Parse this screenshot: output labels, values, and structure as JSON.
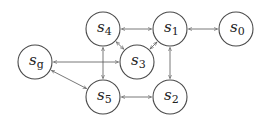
{
  "diagram": {
    "type": "state-graph",
    "node_radius": 17,
    "colors": {
      "stroke": "#4a4a4a",
      "edge": "#555555",
      "text": "#222222",
      "fill": "#ffffff"
    },
    "nodes": [
      {
        "id": "sg",
        "label": "s",
        "sub": "g",
        "x": 35,
        "y": 62
      },
      {
        "id": "s4",
        "label": "s",
        "sub": "4",
        "x": 103,
        "y": 29
      },
      {
        "id": "s1",
        "label": "s",
        "sub": "1",
        "x": 170,
        "y": 29
      },
      {
        "id": "s0",
        "label": "s",
        "sub": "0",
        "x": 236,
        "y": 29
      },
      {
        "id": "s3",
        "label": "s",
        "sub": "3",
        "x": 137,
        "y": 62
      },
      {
        "id": "s5",
        "label": "s",
        "sub": "5",
        "x": 103,
        "y": 97
      },
      {
        "id": "s2",
        "label": "s",
        "sub": "2",
        "x": 170,
        "y": 97
      }
    ],
    "edges": [
      {
        "from": "s4",
        "to": "s1",
        "bidirectional": true
      },
      {
        "from": "s1",
        "to": "s0",
        "bidirectional": true
      },
      {
        "from": "s4",
        "to": "s3",
        "bidirectional": true
      },
      {
        "from": "s1",
        "to": "s3",
        "bidirectional": true
      },
      {
        "from": "s4",
        "to": "s5",
        "bidirectional": true
      },
      {
        "from": "s1",
        "to": "s2",
        "bidirectional": true
      },
      {
        "from": "s5",
        "to": "s2",
        "bidirectional": true
      },
      {
        "from": "sg",
        "to": "s3",
        "bidirectional": true
      },
      {
        "from": "sg",
        "to": "s5",
        "bidirectional": true
      }
    ]
  }
}
